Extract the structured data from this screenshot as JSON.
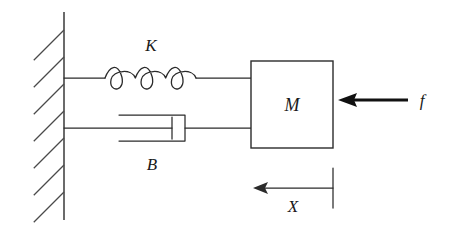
{
  "diagram": {
    "type": "mass-spring-damper-schematic",
    "background_color": "#ffffff",
    "line_color": "#2b2b2b",
    "labels": {
      "spring": "K",
      "damper": "B",
      "mass": "M",
      "force": "f",
      "displacement": "X"
    },
    "components": {
      "wall": {
        "name": "fixed-wall",
        "x": 64,
        "y_top": 12,
        "y_bottom": 220,
        "hatch_count": 7,
        "hatch_angle_deg": 45,
        "hatch_length": 42,
        "hatch_spacing": 27
      },
      "spring": {
        "name": "spring-K",
        "attach_x": 64,
        "y": 78,
        "coil_start_x": 105,
        "coil_end_x": 196,
        "coils": 3,
        "loop_depth": 26,
        "mass_x": 251
      },
      "damper": {
        "name": "damper-B",
        "attach_x": 64,
        "y": 128,
        "cylinder_left": 119,
        "cylinder_right": 185,
        "cylinder_top": 115,
        "cylinder_bottom": 141,
        "piston_x": 172,
        "piston_half_height": 11,
        "mass_x": 251
      },
      "mass": {
        "name": "mass-M",
        "left": 251,
        "right": 333,
        "top": 61,
        "bottom": 148
      },
      "force_arrow": {
        "name": "force-arrow-f",
        "tail_x": 408,
        "head_x": 338,
        "y": 100,
        "style": "bold-left-arrow",
        "label_x": 422,
        "label_y": 106
      },
      "displacement_arrow": {
        "name": "displacement-arrow-X",
        "tail_x": 333,
        "head_x": 253,
        "y": 188,
        "style": "thin-left-arrow",
        "tick_top": 168,
        "tick_bottom": 208,
        "label_x": 293,
        "label_y": 212
      }
    },
    "label_positions": {
      "spring": {
        "x": 151,
        "y": 51
      },
      "damper": {
        "x": 152,
        "y": 170
      },
      "mass": {
        "x": 292,
        "y": 111
      }
    }
  }
}
